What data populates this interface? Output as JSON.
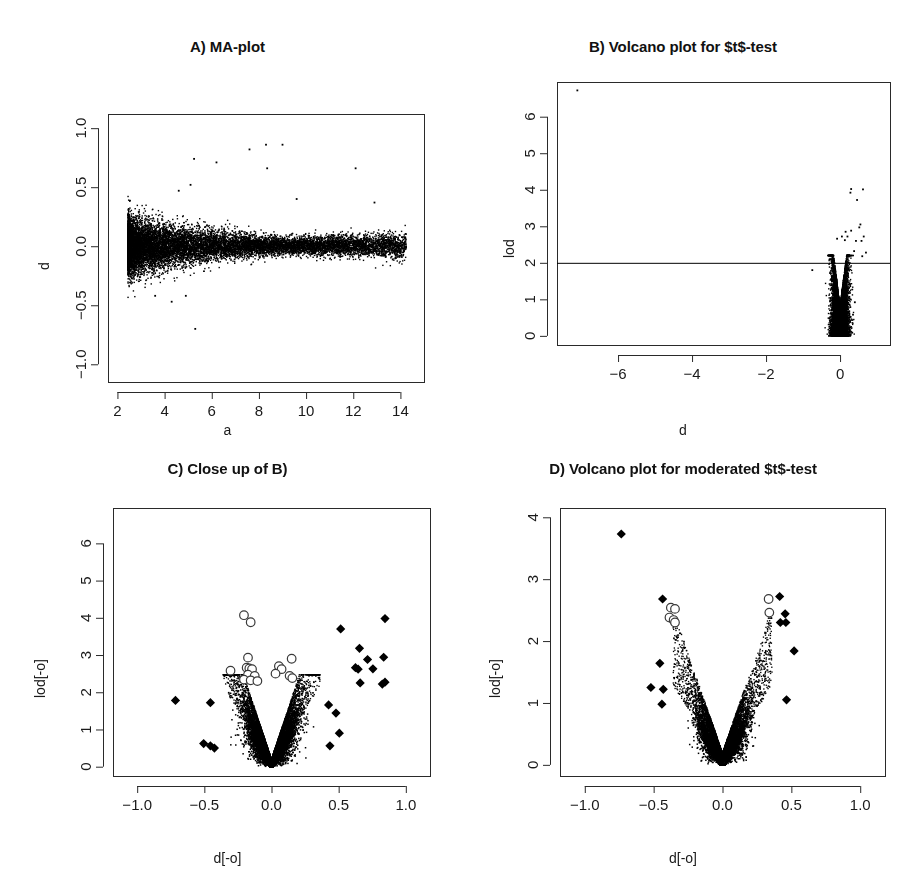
{
  "figure": {
    "width": 911,
    "height": 888,
    "background": "#ffffff",
    "ink": "#111111",
    "layout": "2x2 panel grid of R base-graphics scatter plots"
  },
  "panels": [
    {
      "key": "A",
      "title": "A) MA-plot",
      "xlabel": "a",
      "ylabel": "d"
    },
    {
      "key": "B",
      "title": "B) Volcano plot for $t$-test",
      "xlabel": "d",
      "ylabel": "lod"
    },
    {
      "key": "C",
      "title": "C) Close up of B)",
      "xlabel": "d[-o]",
      "ylabel": "lod[-o]"
    },
    {
      "key": "D",
      "title": "D) Volcano plot for moderated $t$-test",
      "xlabel": "d[-o]",
      "ylabel": "lod[-o]"
    }
  ],
  "chart_data": [
    {
      "id": "A",
      "type": "scatter",
      "title": "A) MA-plot",
      "xlabel": "a",
      "ylabel": "d",
      "xlim": [
        1.6,
        15.0
      ],
      "ylim": [
        -1.15,
        1.12
      ],
      "xticks": [
        2,
        4,
        6,
        8,
        10,
        12,
        14
      ],
      "xticklabels": [
        "2",
        "4",
        "6",
        "8",
        "10",
        "12",
        "14"
      ],
      "yticks": [
        -1.0,
        -0.5,
        0.0,
        0.5,
        1.0
      ],
      "yticklabels": [
        "-1.0",
        "-0.5",
        "0.0",
        "0.5",
        "1.0"
      ],
      "grid": false,
      "legend": null,
      "point_color": "#000000",
      "point_size_px": 1.4,
      "n_points": 12600,
      "cloud": {
        "shape": "horizontal funnel of microarray intensities; spread widest at low a, narrowing toward high a",
        "x_range": [
          2.4,
          14.3
        ],
        "x_density_peak": 5.0,
        "y_center": 0.005,
        "sd_at_x_low": 0.115,
        "sd_at_x_high": 0.035,
        "sd_knee_x": 9.0
      },
      "outliers": [
        {
          "x": 5.25,
          "y": 0.74
        },
        {
          "x": 6.2,
          "y": 0.71
        },
        {
          "x": 7.6,
          "y": 0.82
        },
        {
          "x": 8.3,
          "y": 0.86
        },
        {
          "x": 9.0,
          "y": 0.86
        },
        {
          "x": 8.35,
          "y": 0.66
        },
        {
          "x": 12.1,
          "y": 0.66
        },
        {
          "x": 12.9,
          "y": 0.37
        },
        {
          "x": 4.6,
          "y": 0.47
        },
        {
          "x": 5.1,
          "y": 0.52
        },
        {
          "x": 9.6,
          "y": 0.4
        },
        {
          "x": 5.3,
          "y": -0.7
        },
        {
          "x": 4.3,
          "y": -0.47
        },
        {
          "x": 3.6,
          "y": -0.42
        },
        {
          "x": 4.9,
          "y": -0.42
        }
      ]
    },
    {
      "id": "B",
      "type": "scatter",
      "title": "B) Volcano plot for $t$-test",
      "xlabel": "d",
      "ylabel": "lod",
      "xlim": [
        -7.65,
        1.35
      ],
      "ylim": [
        -0.25,
        6.95
      ],
      "xticks": [
        -6,
        -4,
        -2,
        0
      ],
      "xticklabels": [
        "-6",
        "-4",
        "-2",
        "0"
      ],
      "yticks": [
        0,
        1,
        2,
        3,
        4,
        5,
        6
      ],
      "yticklabels": [
        "0",
        "1",
        "2",
        "3",
        "4",
        "5",
        "6"
      ],
      "grid": false,
      "legend": null,
      "point_color": "#000000",
      "point_size_px": 1.4,
      "n_points": 12600,
      "hline": {
        "y": 2.0,
        "color": "#000000",
        "width": 1
      },
      "cloud": {
        "shape": "tight vertical volcano cloud piled near d=0",
        "x_center": 0.0,
        "x_sd": 0.105,
        "y_max": 2.2
      },
      "outliers": [
        {
          "x": -7.1,
          "y": 6.72
        },
        {
          "x": 0.3,
          "y": 4.02
        },
        {
          "x": 0.62,
          "y": 4.01
        },
        {
          "x": 0.46,
          "y": 3.72
        },
        {
          "x": 0.28,
          "y": 3.92
        },
        {
          "x": 0.55,
          "y": 3.05
        },
        {
          "x": 0.52,
          "y": 2.97
        },
        {
          "x": 0.3,
          "y": 2.88
        },
        {
          "x": 0.64,
          "y": 2.72
        },
        {
          "x": 0.58,
          "y": 2.6
        },
        {
          "x": 0.2,
          "y": 2.72
        },
        {
          "x": 0.13,
          "y": 2.62
        },
        {
          "x": 0.43,
          "y": 2.6
        },
        {
          "x": 0.15,
          "y": 2.85
        },
        {
          "x": 0.7,
          "y": 2.28
        },
        {
          "x": 0.6,
          "y": 2.18
        },
        {
          "x": 0.38,
          "y": 2.32
        },
        {
          "x": -0.08,
          "y": 2.66
        },
        {
          "x": 0.05,
          "y": 2.72
        },
        {
          "x": -0.75,
          "y": 1.8
        },
        {
          "x": 0.4,
          "y": 0.92
        },
        {
          "x": 0.35,
          "y": 0.58
        }
      ]
    },
    {
      "id": "C",
      "type": "scatter",
      "title": "C) Close up of B)",
      "xlabel": "d[-o]",
      "ylabel": "lod[-o]",
      "xlim": [
        -1.18,
        1.18
      ],
      "ylim": [
        -0.25,
        6.95
      ],
      "xticks": [
        -1.0,
        -0.5,
        0.0,
        0.5,
        1.0
      ],
      "xticklabels": [
        "-1.0",
        "-0.5",
        "0.0",
        "0.5",
        "1.0"
      ],
      "yticks": [
        0,
        1,
        2,
        3,
        4,
        5,
        6
      ],
      "yticklabels": [
        "0",
        "1",
        "2",
        "3",
        "4",
        "5",
        "6"
      ],
      "grid": false,
      "legend": null,
      "point_color": "#000000",
      "point_size_px": 1.5,
      "n_points": 12000,
      "cloud": {
        "shape": "V-shaped volcano, arms rising from origin, cusp at (0,0)",
        "x_center": 0.0,
        "x_sd": 0.085,
        "arm_slope": 11.0,
        "y_top": 2.35
      },
      "open_circles": [
        {
          "x": -0.205,
          "y": 4.07
        },
        {
          "x": -0.155,
          "y": 3.88
        },
        {
          "x": -0.175,
          "y": 2.93
        },
        {
          "x": -0.305,
          "y": 2.58
        },
        {
          "x": -0.185,
          "y": 2.66
        },
        {
          "x": -0.165,
          "y": 2.64
        },
        {
          "x": -0.145,
          "y": 2.62
        },
        {
          "x": -0.175,
          "y": 2.47
        },
        {
          "x": -0.125,
          "y": 2.44
        },
        {
          "x": -0.205,
          "y": 2.34
        },
        {
          "x": -0.155,
          "y": 2.32
        },
        {
          "x": -0.105,
          "y": 2.3
        },
        {
          "x": 0.055,
          "y": 2.7
        },
        {
          "x": 0.075,
          "y": 2.62
        },
        {
          "x": 0.15,
          "y": 2.9
        },
        {
          "x": 0.135,
          "y": 2.44
        },
        {
          "x": 0.155,
          "y": 2.38
        },
        {
          "x": 0.03,
          "y": 2.5
        }
      ],
      "filled_diamonds": [
        {
          "x": 0.845,
          "y": 3.98
        },
        {
          "x": 0.515,
          "y": 3.7
        },
        {
          "x": 0.655,
          "y": 3.18
        },
        {
          "x": 0.835,
          "y": 2.94
        },
        {
          "x": 0.715,
          "y": 2.88
        },
        {
          "x": 0.625,
          "y": 2.66
        },
        {
          "x": 0.645,
          "y": 2.62
        },
        {
          "x": 0.755,
          "y": 2.63
        },
        {
          "x": 0.66,
          "y": 2.25
        },
        {
          "x": 0.825,
          "y": 2.22
        },
        {
          "x": 0.845,
          "y": 2.27
        },
        {
          "x": -0.715,
          "y": 1.78
        },
        {
          "x": -0.455,
          "y": 1.72
        },
        {
          "x": 0.425,
          "y": 1.66
        },
        {
          "x": 0.48,
          "y": 1.44
        },
        {
          "x": 0.505,
          "y": 0.9
        },
        {
          "x": 0.435,
          "y": 0.56
        },
        {
          "x": -0.505,
          "y": 0.62
        },
        {
          "x": -0.455,
          "y": 0.56
        },
        {
          "x": -0.425,
          "y": 0.5
        }
      ]
    },
    {
      "id": "D",
      "type": "scatter",
      "title": "D) Volcano plot for moderated $t$-test",
      "xlabel": "d[-o]",
      "ylabel": "lod[-o]",
      "xlim": [
        -1.18,
        1.18
      ],
      "ylim": [
        -0.18,
        4.15
      ],
      "xticks": [
        -1.0,
        -0.5,
        0.0,
        0.5,
        1.0
      ],
      "xticklabels": [
        "-1.0",
        "-0.5",
        "0.0",
        "0.5",
        "1.0"
      ],
      "yticks": [
        0,
        1,
        2,
        3,
        4
      ],
      "yticklabels": [
        "0",
        "1",
        "2",
        "3",
        "4"
      ],
      "grid": false,
      "legend": null,
      "point_color": "#000000",
      "point_size_px": 1.5,
      "n_points": 12000,
      "cloud": {
        "shape": "narrow symmetric V volcano, sharp cusp at origin, arms to d=±0.35",
        "x_center": 0.0,
        "x_sd": 0.075,
        "arm_slope": 6.5,
        "y_top": 2.25
      },
      "open_circles": [
        {
          "x": -0.375,
          "y": 2.54
        },
        {
          "x": -0.345,
          "y": 2.52
        },
        {
          "x": -0.385,
          "y": 2.38
        },
        {
          "x": -0.355,
          "y": 2.34
        },
        {
          "x": -0.345,
          "y": 2.3
        },
        {
          "x": 0.335,
          "y": 2.68
        },
        {
          "x": 0.34,
          "y": 2.46
        }
      ],
      "filled_diamonds": [
        {
          "x": -0.735,
          "y": 3.73
        },
        {
          "x": -0.435,
          "y": 2.68
        },
        {
          "x": 0.415,
          "y": 2.72
        },
        {
          "x": 0.455,
          "y": 2.44
        },
        {
          "x": 0.42,
          "y": 2.3
        },
        {
          "x": 0.46,
          "y": 2.3
        },
        {
          "x": 0.52,
          "y": 1.84
        },
        {
          "x": -0.455,
          "y": 1.64
        },
        {
          "x": -0.52,
          "y": 1.25
        },
        {
          "x": -0.43,
          "y": 1.22
        },
        {
          "x": -0.44,
          "y": 0.98
        },
        {
          "x": 0.465,
          "y": 1.05
        }
      ]
    }
  ]
}
